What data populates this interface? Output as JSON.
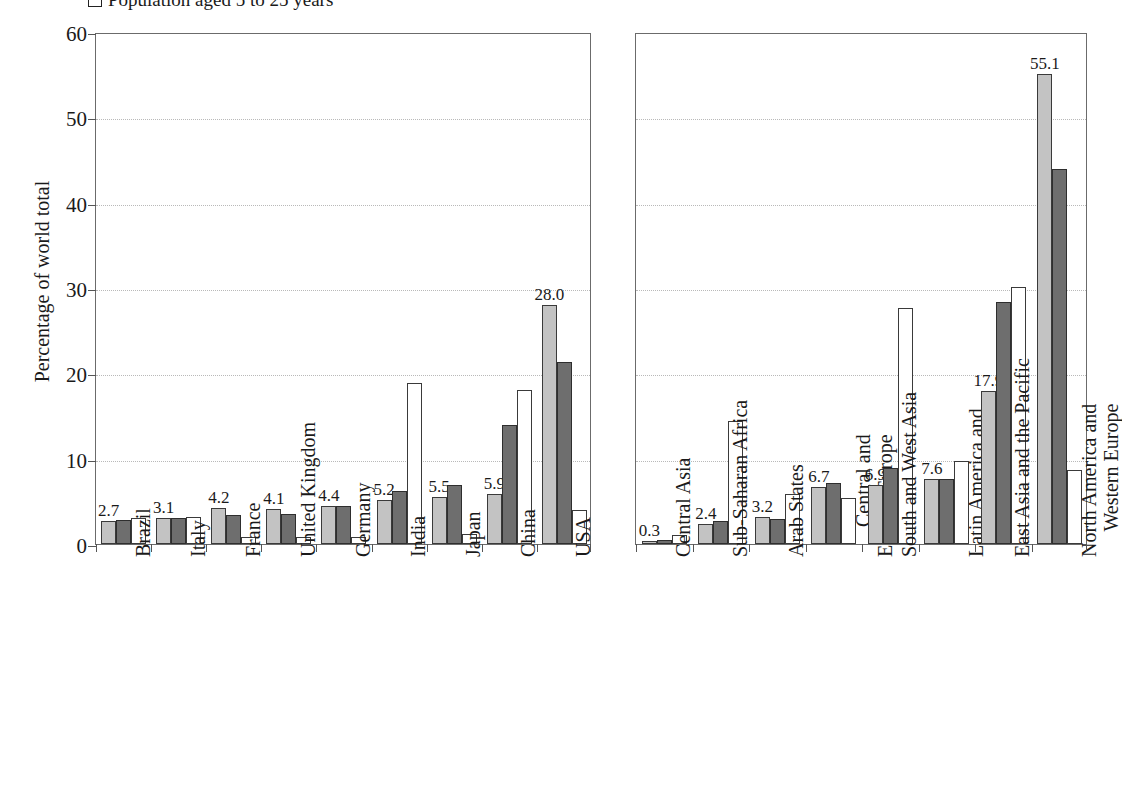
{
  "legend": {
    "swatch": "open-square",
    "label": "Population aged 5 to 25 years"
  },
  "axis": {
    "y_title": "Percentage of world total",
    "y_ticks": [
      "0",
      "10",
      "20",
      "30",
      "40",
      "50",
      "60"
    ]
  },
  "chart_data": {
    "type": "bar",
    "title": "",
    "xlabel": "",
    "ylabel": "Percentage of world total",
    "ylim": [
      0,
      60
    ],
    "yticks": [
      0,
      10,
      20,
      30,
      40,
      50,
      60
    ],
    "grid": "horizontal-dotted",
    "legend_position": "top-left",
    "series_styles": [
      "light-gray",
      "dark-gray",
      "white"
    ],
    "panels": [
      {
        "name": "countries",
        "categories": [
          "Brazil",
          "Italy",
          "France",
          "United Kingdom",
          "Germany",
          "India",
          "Japan",
          "China",
          "USA"
        ],
        "series": [
          {
            "name": "series-1",
            "values": [
              2.7,
              3.1,
              4.2,
              4.1,
              4.4,
              5.2,
              5.5,
              5.9,
              28.0
            ]
          },
          {
            "name": "series-2",
            "values": [
              2.8,
              3.0,
              3.4,
              3.5,
              4.4,
              6.2,
              6.9,
              13.9,
              21.3
            ]
          },
          {
            "name": "series-3",
            "values": [
              3.0,
              3.2,
              0.8,
              0.8,
              0.8,
              18.9,
              1.2,
              18.0,
              4.0
            ]
          }
        ],
        "labels": [
          "2.7",
          "3.1",
          "4.2",
          "4.1",
          "4.4",
          "5.2",
          "5.5",
          "5.9",
          "28.0"
        ]
      },
      {
        "name": "regions",
        "categories": [
          "Central Asia",
          "Sub-Saharan Africa",
          "Arab States",
          "Central and|Eastern Europe",
          "South and West Asia",
          "Latin America and|the Caribbean",
          "East Asia and the Pacific",
          "North America and|Western Europe"
        ],
        "series": [
          {
            "name": "series-1",
            "values": [
              0.3,
              2.4,
              3.2,
              6.7,
              6.9,
              7.6,
              17.9,
              55.1
            ]
          },
          {
            "name": "series-2",
            "values": [
              0.5,
              2.7,
              2.9,
              7.2,
              8.9,
              7.6,
              28.4,
              43.9
            ]
          },
          {
            "name": "series-3",
            "values": [
              1.0,
              14.4,
              5.9,
              5.4,
              27.6,
              9.7,
              30.1,
              8.7
            ]
          }
        ],
        "labels": [
          "0.3",
          "2.4",
          "3.2",
          "6.7",
          "6.9",
          "7.6",
          "17.9",
          "55.1"
        ]
      }
    ]
  }
}
